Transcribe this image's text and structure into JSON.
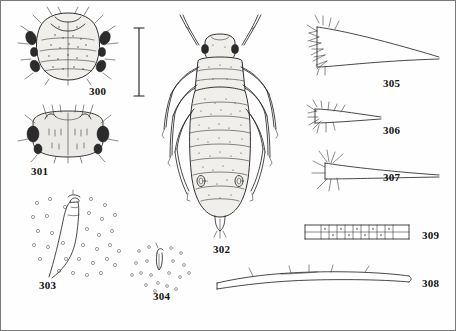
{
  "plate": {
    "caption_font_note": "",
    "figures": [
      {
        "number": "300",
        "name": "dorsal-habitus-head-thorax",
        "label_x": 88,
        "label_y": 88,
        "description": "Dorsal view of head and thorax with setae"
      },
      {
        "number": "301",
        "name": "head-frontal-view",
        "label_x": 30,
        "label_y": 170,
        "description": "Frontal view of head with antennal tubercles"
      },
      {
        "number": "302",
        "name": "full-dorsal-habitus",
        "label_x": 212,
        "label_y": 247,
        "description": "Complete dorsal habitus of apterous aphid"
      },
      {
        "number": "303",
        "name": "siphunculus-detail",
        "label_x": 38,
        "label_y": 283,
        "description": "Siphunculus with surrounding dots"
      },
      {
        "number": "304",
        "name": "cauda-detail",
        "label_x": 152,
        "label_y": 294,
        "description": "Cauda with scattered dots"
      },
      {
        "number": "305",
        "name": "antennal-segment-iii",
        "label_x": 382,
        "label_y": 80,
        "description": "Antennal segment III with setae"
      },
      {
        "number": "306",
        "name": "antennal-segment-setae",
        "label_x": 382,
        "label_y": 128,
        "description": "Antennal segment with setae detail"
      },
      {
        "number": "307",
        "name": "antennal-base-setae",
        "label_x": 382,
        "label_y": 175,
        "description": "Antennal base with long setae"
      },
      {
        "number": "309",
        "name": "siphunculus-reticulate",
        "label_x": 423,
        "label_y": 233,
        "description": "Reticulate siphunculus, lateral"
      },
      {
        "number": "308",
        "name": "antenna-whole",
        "label_x": 423,
        "label_y": 281,
        "description": "Whole antenna, elongate"
      }
    ],
    "scale_bar": {
      "name": "scale-bar",
      "x": 137,
      "y_top": 28,
      "y_bottom": 93
    }
  }
}
